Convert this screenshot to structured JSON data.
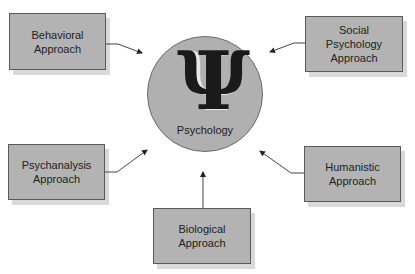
{
  "diagram": {
    "center": {
      "symbol": "Ψ",
      "label": "Psychology",
      "fill": "#b0b0b0"
    },
    "nodes": [
      {
        "id": "behavioral",
        "lines": [
          "Behavioral",
          "Approach"
        ]
      },
      {
        "id": "social",
        "lines": [
          "Social",
          "Psychology",
          "Approach"
        ]
      },
      {
        "id": "psychanalysis",
        "lines": [
          "Psychanalysis",
          "Approach"
        ]
      },
      {
        "id": "humanistic",
        "lines": [
          "Humanistic",
          "Approach"
        ]
      },
      {
        "id": "biological",
        "lines": [
          "Biological",
          "Approach"
        ]
      }
    ],
    "edges": [
      {
        "from": "behavioral",
        "to": "center"
      },
      {
        "from": "social",
        "to": "center"
      },
      {
        "from": "psychanalysis",
        "to": "center"
      },
      {
        "from": "humanistic",
        "to": "center"
      },
      {
        "from": "biological",
        "to": "center"
      }
    ],
    "colors": {
      "box_fill": "#b3b3b3",
      "box_border": "#5a5a5a",
      "shadow": "#d9d9d9",
      "arrow": "#444444"
    }
  }
}
